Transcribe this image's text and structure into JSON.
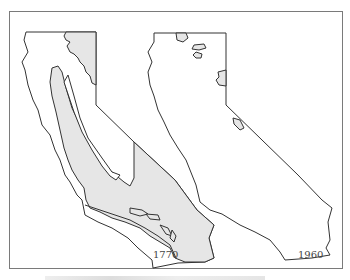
{
  "figure": {
    "type": "comparative map",
    "panels": [
      {
        "id": "left",
        "year_label": "1770",
        "shade_color": "#e6e6e6",
        "description": "Large shaded areas: northeastern region, Central Valley, southern coastal strips"
      },
      {
        "id": "right",
        "year_label": "1960",
        "shade_color": "#e6e6e6",
        "description": "Only small scattered shaded patches remain"
      }
    ],
    "outline_color": "#333333",
    "frame_color": "#7a7a7a"
  }
}
